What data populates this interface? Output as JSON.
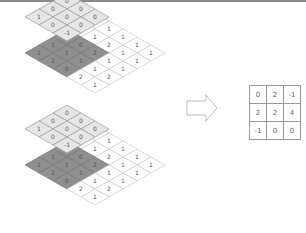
{
  "diagram": {
    "input_grid": [
      [
        1,
        1,
        1,
        1,
        1
      ],
      [
        0,
        1,
        2,
        1,
        1
      ],
      [
        1,
        0,
        2,
        1,
        1
      ],
      [
        1,
        1,
        1,
        1,
        2
      ],
      [
        1,
        2,
        0,
        2,
        1
      ]
    ],
    "kernel": [
      [
        0,
        0,
        0
      ],
      [
        0,
        0,
        0
      ],
      [
        1,
        0,
        -1
      ]
    ],
    "steps": [
      {
        "label": "step-1",
        "kernel_position": "top-left"
      },
      {
        "label": "step-2",
        "kernel_position": "shifted"
      }
    ],
    "arrow": "right-arrow",
    "output_matrix": [
      [
        "0",
        "2",
        "-1"
      ],
      [
        "2",
        "2",
        "4"
      ],
      [
        "-1",
        "0",
        "0"
      ]
    ],
    "colors": {
      "kernel_fill": "#e6e6e6",
      "highlight_fill": "#8f8f8f",
      "grid_line": "#c8c8c8",
      "output_border": "#9a9a9a"
    }
  }
}
